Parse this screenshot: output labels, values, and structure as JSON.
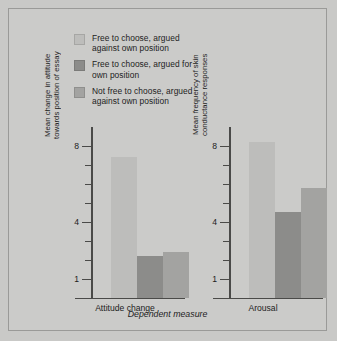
{
  "figure": {
    "background_color": "#cbcbc9",
    "border_color": "#9a9a98"
  },
  "legend": {
    "items": [
      {
        "label": "Free to choose, argued\nagainst own position",
        "color": "#bdbdbb",
        "name": "free-against"
      },
      {
        "label": "Free to choose, argued for\nown position",
        "color": "#8c8c8a",
        "name": "free-for"
      },
      {
        "label": "Not free to choose, argued\nagainst own position",
        "color": "#a3a3a1",
        "name": "notfree-against"
      }
    ]
  },
  "axes": {
    "x_title": "Dependent measure",
    "tick_labels": [
      "8",
      "4",
      "1"
    ],
    "y_min": 0,
    "y_max": 9
  },
  "panels": [
    {
      "name": "attitude-change",
      "x_label": "Attitude change",
      "y_title": "Mean change in attitude\ntowards position of essay"
    },
    {
      "name": "arousal",
      "x_label": "Arousal",
      "y_title": "Mean frequency of skin\nconductance responses"
    }
  ],
  "chart_data": {
    "type": "bar",
    "title": "",
    "xlabel": "Dependent measure",
    "ylabel": "",
    "ylim": [
      0,
      9
    ],
    "grid": false,
    "legend_position": "top-left",
    "categories": [
      "Attitude change",
      "Arousal"
    ],
    "series": [
      {
        "name": "Free to choose, argued against own position",
        "color": "#bdbdbb",
        "values": [
          7.4,
          8.2
        ]
      },
      {
        "name": "Free to choose, argued for own position",
        "color": "#8c8c8a",
        "values": [
          2.2,
          4.5
        ]
      },
      {
        "name": "Not free to choose, argued against own position",
        "color": "#a3a3a1",
        "values": [
          2.4,
          5.8
        ]
      }
    ],
    "panels": [
      {
        "name": "Attitude change",
        "ylabel": "Mean change in attitude towards position of essay",
        "tick_values": [
          1,
          4,
          8
        ],
        "values": [
          7.4,
          2.2,
          2.4
        ]
      },
      {
        "name": "Arousal",
        "ylabel": "Mean frequency of skin conductance responses",
        "tick_values": [
          1,
          4,
          8
        ],
        "values": [
          8.2,
          4.5,
          5.8
        ]
      }
    ]
  }
}
